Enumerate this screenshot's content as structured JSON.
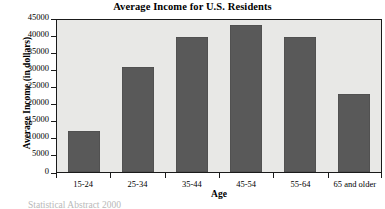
{
  "chart_data": {
    "type": "bar",
    "title": "Average Income for U.S. Residents",
    "xlabel": "Age",
    "ylabel": "Average Income (in dollars)",
    "categories": [
      "15-24",
      "25-34",
      "35-44",
      "45-54",
      "55-64",
      "65 and older"
    ],
    "values": [
      12000,
      31000,
      40000,
      43500,
      40000,
      23000
    ],
    "ylim": [
      0,
      45000
    ],
    "ytick_values": [
      0,
      5000,
      10000,
      15000,
      20000,
      25000,
      30000,
      35000,
      40000,
      45000
    ],
    "ytick_labels": [
      "0",
      "5000",
      "10000",
      "15000",
      "20000",
      "25000",
      "30000",
      "35000",
      "40000",
      "45000"
    ],
    "grid": false,
    "legend": null,
    "bar_color": "#595959",
    "plot_background": "#e8e8e6",
    "axis_color": "#1a1a1a"
  },
  "footer": {
    "source_note": "Statistical Abstract 2000"
  }
}
